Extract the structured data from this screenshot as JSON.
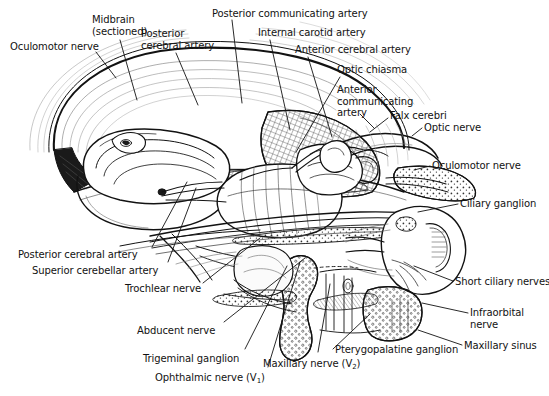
{
  "figure": {
    "background_color": "#ffffff",
    "ink_color": "#121212",
    "width": 549,
    "height": 396
  },
  "labels": [
    {
      "id": "oculomotor-nerve-left",
      "text": "Oculomotor nerve",
      "x": 10,
      "y": 41,
      "align": "left"
    },
    {
      "id": "midbrain-sectioned",
      "text": "Midbrain\n(sectioned)",
      "x": 92,
      "y": 14,
      "align": "left"
    },
    {
      "id": "posterior-cerebral-artery-top",
      "text": "Posterior\ncerebral artery",
      "x": 141,
      "y": 28,
      "align": "left"
    },
    {
      "id": "posterior-communicating-artery",
      "text": "Posterior communicating artery",
      "x": 212,
      "y": 8,
      "align": "left"
    },
    {
      "id": "internal-carotid-artery",
      "text": "Internal carotid artery",
      "x": 258,
      "y": 27,
      "align": "left"
    },
    {
      "id": "anterior-cerebral-artery",
      "text": "Anterior cerebral artery",
      "x": 295,
      "y": 44,
      "align": "left"
    },
    {
      "id": "optic-chiasma",
      "text": "Optic chiasma",
      "x": 337,
      "y": 64,
      "align": "left"
    },
    {
      "id": "anterior-communicating-artery",
      "text": "Anterior\ncommunicating\nartery",
      "x": 337,
      "y": 84,
      "align": "left"
    },
    {
      "id": "falx-cerebri",
      "text": "Falx cerebri",
      "x": 390,
      "y": 110,
      "align": "left"
    },
    {
      "id": "optic-nerve",
      "text": "Optic nerve",
      "x": 424,
      "y": 122,
      "align": "left"
    },
    {
      "id": "oculomotor-nerve-right",
      "text": "Oculomotor nerve",
      "x": 432,
      "y": 160,
      "align": "left"
    },
    {
      "id": "ciliary-ganglion",
      "text": "Ciliary ganglion",
      "x": 460,
      "y": 198,
      "align": "left"
    },
    {
      "id": "short-ciliary-nerves",
      "text": "Short ciliary nerves",
      "x": 455,
      "y": 276,
      "align": "left"
    },
    {
      "id": "infraorbital-nerve",
      "text": "Infraorbital\nnerve",
      "x": 470,
      "y": 307,
      "align": "left"
    },
    {
      "id": "maxillary-sinus",
      "text": "Maxillary sinus",
      "x": 464,
      "y": 340,
      "align": "left"
    },
    {
      "id": "posterior-cerebral-artery-bottom",
      "text": "Posterior cerebral artery",
      "x": 18,
      "y": 249,
      "align": "left"
    },
    {
      "id": "superior-cerebellar-artery",
      "text": "Superior cerebellar artery",
      "x": 32,
      "y": 265,
      "align": "left"
    },
    {
      "id": "trochlear-nerve",
      "text": "Trochlear nerve",
      "x": 125,
      "y": 283,
      "align": "left"
    },
    {
      "id": "abducent-nerve",
      "text": "Abducent nerve",
      "x": 137,
      "y": 325,
      "align": "left"
    },
    {
      "id": "trigeminal-ganglion",
      "text": "Trigeminal ganglion",
      "x": 143,
      "y": 353,
      "align": "left"
    },
    {
      "id": "ophthalmic-nerve",
      "text": "Ophthalmic nerve (V",
      "x": 155,
      "y": 372,
      "align": "left",
      "subscript": "1",
      "suffix": ")"
    },
    {
      "id": "maxillary-nerve",
      "text": "Maxillary nerve (V",
      "x": 263,
      "y": 358,
      "align": "left",
      "subscript": "2",
      "suffix": ")"
    },
    {
      "id": "pterygopalatine-ganglion",
      "text": "Pterygopalatine ganglion",
      "x": 335,
      "y": 344,
      "align": "left"
    }
  ],
  "leader_lines": [
    {
      "id": "leader-oculomotor-left",
      "points": "96,52 116,78"
    },
    {
      "id": "leader-midbrain",
      "points": "120,40 137,100"
    },
    {
      "id": "leader-posterior-cerebral-top",
      "points": "176,53 198,105"
    },
    {
      "id": "leader-posterior-communicating",
      "points": "232,20 242,103"
    },
    {
      "id": "leader-internal-carotid",
      "points": "270,40 290,130"
    },
    {
      "id": "leader-anterior-cerebral",
      "points": "308,57 332,137"
    },
    {
      "id": "leader-optic-chiasma",
      "points": "340,77 296,152"
    },
    {
      "id": "leader-anterior-communicating",
      "points": "360,114 374,128"
    },
    {
      "id": "leader-falx-cerebri",
      "points": "388,118 370,132"
    },
    {
      "id": "leader-optic-nerve",
      "points": "422,128 412,136"
    },
    {
      "id": "leader-oculomotor-right",
      "points": "430,166 414,170"
    },
    {
      "id": "leader-ciliary-ganglion",
      "points": "458,204 418,212"
    },
    {
      "id": "leader-short-ciliary",
      "points": "453,281 414,266"
    },
    {
      "id": "leader-infraorbital",
      "points": "468,313 422,303"
    },
    {
      "id": "leader-maxillary-sinus",
      "points": "462,345 418,330"
    },
    {
      "id": "leader-posterior-cerebral-bottom",
      "points": "152,247 187,182"
    },
    {
      "id": "leader-superior-cerebellar",
      "points": "168,262 196,188"
    },
    {
      "id": "leader-trochlear",
      "points": "203,283 260,238"
    },
    {
      "id": "leader-abducent",
      "points": "224,322 305,258"
    },
    {
      "id": "leader-trigeminal-ganglion",
      "points": "245,349 287,266"
    },
    {
      "id": "leader-ophthalmic",
      "points": "268,367 300,262"
    },
    {
      "id": "leader-maxillary-nerve",
      "points": "318,352 330,284"
    },
    {
      "id": "leader-pterygopalatine",
      "points": "333,349 370,314"
    }
  ]
}
